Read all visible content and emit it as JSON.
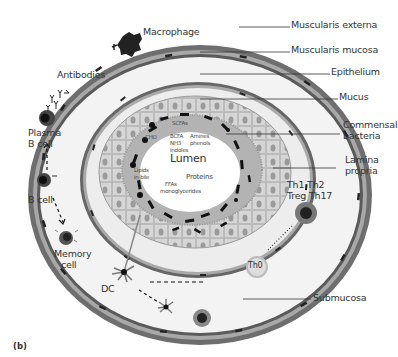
{
  "header_fragment": "",
  "figure_tag": "(b)",
  "caption_fragment": "... the mucosal immune system... in the gut ... microbial composition",
  "labels": {
    "macrophage": "Macrophage",
    "muscularis_externa": "Muscularis externa",
    "muscularis_mucosa": "Muscularis mucosa",
    "epithelium": "Epithelium",
    "mucus": "Mucus",
    "commensal_bacteria_1": "Commensal",
    "commensal_bacteria_2": "bacteria",
    "lamina_propria_1": "Lamina",
    "lamina_propria_2": "propria",
    "antibodies": "Antibodies",
    "plasma_b_cell_1": "Plasma",
    "plasma_b_cell_2": "B cell",
    "b_cell": "B cell",
    "memory_cell_1": "Memory",
    "memory_cell_2": "cell",
    "dc": "DC",
    "th_subsets_1": "Th1  Th2",
    "th_subsets_2": "Treg Th17",
    "th0": "Th0",
    "submucosa": "Submucosa",
    "lumen": "Lumen",
    "scfas": "SCFAs",
    "cho": "CHO",
    "bcfa_1": "BCFA",
    "bcfa_2": "NH3",
    "bcfa_3": "indoles",
    "amines_1": "Amines",
    "amines_2": "phenols",
    "proteins": "Proteins",
    "lipids_1": "Lipids",
    "lipids_2": "in bile",
    "ffas_1": "FFAs",
    "ffas_2": "monoglycerides"
  },
  "colors": {
    "outer_wall": "#7a7a7a",
    "submucosa_fill": "#f2f2f2",
    "lamina_fill": "#ebebeb",
    "epithelium_fill": "#d2d2d2",
    "mucus_fill": "#b8b8b8",
    "lumen_fill": "#ffffff",
    "bacteria": "#111111",
    "leader_line": "#333333"
  }
}
